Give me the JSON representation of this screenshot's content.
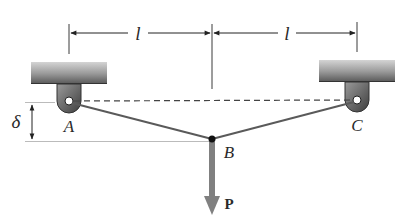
{
  "diagram": {
    "labels": {
      "span_left": "l",
      "span_right": "l",
      "deflection": "δ",
      "support_left": "A",
      "support_right": "C",
      "joint": "B",
      "load": "P"
    },
    "colors": {
      "line": "#4a4a4a",
      "dim_line": "#3a3a3a",
      "support_dark": "#555555",
      "support_light": "#bdbdbd",
      "load_arrow": "#808080",
      "joint": "#111111"
    }
  }
}
